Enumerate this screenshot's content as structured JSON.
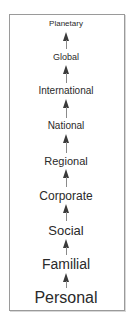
{
  "diagram": {
    "type": "vertical-hierarchy",
    "direction": "bottom-to-top",
    "levels": [
      {
        "label": "Planetary",
        "font_size": 8,
        "y": 24
      },
      {
        "label": "Global",
        "font_size": 9,
        "y": 57
      },
      {
        "label": "International",
        "font_size": 10,
        "y": 91
      },
      {
        "label": "National",
        "font_size": 10,
        "y": 126
      },
      {
        "label": "Regional",
        "font_size": 11,
        "y": 161
      },
      {
        "label": "Corporate",
        "font_size": 12,
        "y": 196
      },
      {
        "label": "Social",
        "font_size": 13,
        "y": 230
      },
      {
        "label": "Familial",
        "font_size": 14,
        "y": 264
      },
      {
        "label": "Personal",
        "font_size": 16,
        "y": 298
      }
    ],
    "arrows": [
      {
        "from": "Global",
        "to": "Planetary",
        "top": 32,
        "height": 17
      },
      {
        "from": "International",
        "to": "Global",
        "top": 65,
        "height": 18
      },
      {
        "from": "National",
        "to": "International",
        "top": 99,
        "height": 19
      },
      {
        "from": "Regional",
        "to": "National",
        "top": 134,
        "height": 19
      },
      {
        "from": "Corporate",
        "to": "Regional",
        "top": 169,
        "height": 18
      },
      {
        "from": "Social",
        "to": "Corporate",
        "top": 204,
        "height": 17
      },
      {
        "from": "Familial",
        "to": "Social",
        "top": 239,
        "height": 16
      },
      {
        "from": "Personal",
        "to": "Familial",
        "top": 273,
        "height": 15
      }
    ],
    "colors": {
      "text": "#2a2a2a",
      "arrow": "#3a3a3a",
      "border": "#9a9a9a",
      "background": "#ffffff"
    }
  }
}
